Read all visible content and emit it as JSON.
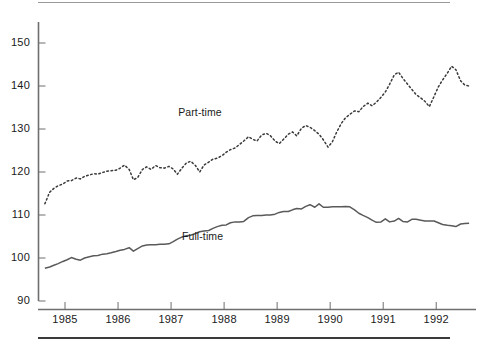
{
  "chart_data": {
    "type": "line",
    "title": "",
    "subtitle": "",
    "xlabel": "",
    "ylabel": "",
    "ylim": [
      90,
      155
    ],
    "xlim": [
      1984.5,
      1992.75
    ],
    "yticks": [
      90,
      100,
      110,
      120,
      130,
      140,
      150
    ],
    "ytick_labels": [
      "90",
      "100",
      "110",
      "120",
      "130",
      "140",
      "150"
    ],
    "xticks": [
      1985,
      1986,
      1987,
      1988,
      1989,
      1990,
      1991,
      1992
    ],
    "xtick_labels": [
      "1985",
      "1986",
      "1987",
      "1988",
      "1989",
      "1990",
      "1991",
      "1992"
    ],
    "grid": false,
    "legend_position": "inline-annotations",
    "colors": {
      "part_time": "#3a3a3a",
      "full_time": "#5a5a5a",
      "axis": "#6e6e6e",
      "text": "#1a1a1a",
      "background": "#ffffff"
    },
    "series": [
      {
        "name": "Part-time",
        "style": "dotted",
        "label_x": 1987.55,
        "label_y": 133.8,
        "x": [
          1984.62,
          1984.71,
          1984.79,
          1984.87,
          1984.96,
          1985.04,
          1985.12,
          1985.21,
          1985.29,
          1985.37,
          1985.46,
          1985.54,
          1985.62,
          1985.71,
          1985.79,
          1985.87,
          1985.96,
          1986.04,
          1986.12,
          1986.21,
          1986.29,
          1986.37,
          1986.46,
          1986.54,
          1986.62,
          1986.71,
          1986.79,
          1986.87,
          1986.96,
          1987.04,
          1987.12,
          1987.21,
          1987.29,
          1987.37,
          1987.46,
          1987.54,
          1987.62,
          1987.71,
          1987.79,
          1987.87,
          1987.96,
          1988.04,
          1988.12,
          1988.21,
          1988.29,
          1988.37,
          1988.46,
          1988.54,
          1988.62,
          1988.71,
          1988.79,
          1988.87,
          1988.96,
          1989.04,
          1989.12,
          1989.21,
          1989.29,
          1989.37,
          1989.46,
          1989.54,
          1989.62,
          1989.71,
          1989.79,
          1989.87,
          1989.96,
          1990.04,
          1990.12,
          1990.21,
          1990.29,
          1990.37,
          1990.46,
          1990.54,
          1990.62,
          1990.71,
          1990.79,
          1990.87,
          1990.96,
          1991.04,
          1991.12,
          1991.21,
          1991.29,
          1991.37,
          1991.46,
          1991.54,
          1991.62,
          1991.71,
          1991.79,
          1991.87,
          1991.96,
          1992.04,
          1992.12,
          1992.21,
          1992.29,
          1992.37,
          1992.46,
          1992.54,
          1992.62
        ],
        "y": [
          112.6,
          115.3,
          116.2,
          116.8,
          117.2,
          117.9,
          118.0,
          118.6,
          118.4,
          119.0,
          119.3,
          119.6,
          119.5,
          119.9,
          120.2,
          120.3,
          120.4,
          120.9,
          121.6,
          120.6,
          118.2,
          118.7,
          120.6,
          121.2,
          120.6,
          121.5,
          121.0,
          120.9,
          121.3,
          120.7,
          119.5,
          121.0,
          122.1,
          122.5,
          121.5,
          120.0,
          121.6,
          122.3,
          123.0,
          123.2,
          123.8,
          124.6,
          125.2,
          125.6,
          126.4,
          127.2,
          128.2,
          127.6,
          127.2,
          128.6,
          129.0,
          128.5,
          127.2,
          126.6,
          127.6,
          128.8,
          129.3,
          128.4,
          130.2,
          130.8,
          130.4,
          129.6,
          128.8,
          127.5,
          125.8,
          127.0,
          129.2,
          131.3,
          132.6,
          133.4,
          134.2,
          134.0,
          135.2,
          136.0,
          135.4,
          136.2,
          137.4,
          138.6,
          140.4,
          142.6,
          143.2,
          141.8,
          140.4,
          139.2,
          138.0,
          137.2,
          136.4,
          135.2,
          137.6,
          139.8,
          141.4,
          143.0,
          144.6,
          143.8,
          141.2,
          140.2,
          140.0
        ]
      },
      {
        "name": "Full-time",
        "style": "solid",
        "label_x": 1987.62,
        "label_y": 105.0,
        "x": [
          1984.62,
          1984.71,
          1984.79,
          1984.87,
          1984.96,
          1985.04,
          1985.12,
          1985.21,
          1985.29,
          1985.37,
          1985.46,
          1985.54,
          1985.62,
          1985.71,
          1985.79,
          1985.87,
          1985.96,
          1986.04,
          1986.12,
          1986.21,
          1986.29,
          1986.37,
          1986.46,
          1986.54,
          1986.62,
          1986.71,
          1986.79,
          1986.87,
          1986.96,
          1987.04,
          1987.12,
          1987.21,
          1987.29,
          1987.37,
          1987.46,
          1987.54,
          1987.62,
          1987.71,
          1987.79,
          1987.87,
          1987.96,
          1988.04,
          1988.12,
          1988.21,
          1988.29,
          1988.37,
          1988.46,
          1988.54,
          1988.62,
          1988.71,
          1988.79,
          1988.87,
          1988.96,
          1989.04,
          1989.12,
          1989.21,
          1989.29,
          1989.37,
          1989.46,
          1989.54,
          1989.62,
          1989.71,
          1989.79,
          1989.87,
          1989.96,
          1990.04,
          1990.12,
          1990.21,
          1990.29,
          1990.37,
          1990.46,
          1990.54,
          1990.62,
          1990.71,
          1990.79,
          1990.87,
          1990.96,
          1991.04,
          1991.12,
          1991.21,
          1991.29,
          1991.37,
          1991.46,
          1991.54,
          1991.62,
          1991.71,
          1991.79,
          1991.87,
          1991.96,
          1992.04,
          1992.12,
          1992.21,
          1992.29,
          1992.37,
          1992.46,
          1992.54,
          1992.62
        ],
        "y": [
          97.6,
          97.9,
          98.3,
          98.7,
          99.2,
          99.6,
          100.1,
          99.7,
          99.5,
          100.0,
          100.3,
          100.5,
          100.6,
          100.9,
          101.0,
          101.2,
          101.5,
          101.8,
          102.0,
          102.4,
          101.6,
          102.2,
          102.8,
          103.0,
          103.1,
          103.1,
          103.2,
          103.2,
          103.3,
          103.8,
          104.4,
          104.9,
          105.2,
          105.3,
          105.7,
          106.1,
          106.3,
          106.4,
          106.9,
          107.3,
          107.6,
          107.7,
          108.2,
          108.4,
          108.4,
          108.5,
          109.4,
          109.8,
          109.9,
          109.9,
          110.0,
          110.0,
          110.2,
          110.6,
          110.8,
          110.8,
          111.2,
          111.5,
          111.4,
          112.0,
          112.4,
          111.8,
          112.6,
          111.8,
          111.8,
          111.9,
          111.9,
          111.9,
          112.0,
          111.9,
          111.2,
          110.4,
          109.9,
          109.4,
          108.8,
          108.3,
          108.4,
          109.1,
          108.4,
          108.6,
          109.2,
          108.5,
          108.4,
          109.0,
          109.0,
          108.8,
          108.6,
          108.6,
          108.6,
          108.2,
          107.8,
          107.6,
          107.5,
          107.3,
          107.9,
          108.0,
          108.1
        ]
      }
    ]
  }
}
